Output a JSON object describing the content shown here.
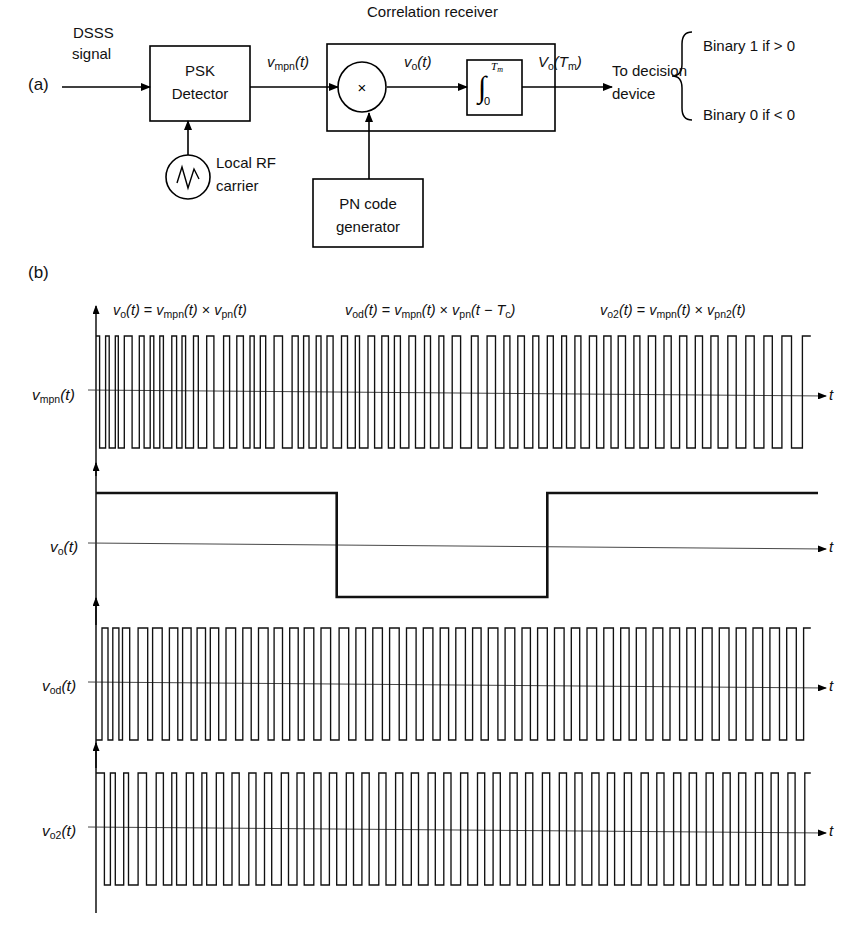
{
  "figure": {
    "panel_a_label": "(a)",
    "panel_b_label": "(b)"
  },
  "block_diagram": {
    "input_label_line1": "DSSS",
    "input_label_line2": "signal",
    "receiver_box_title": "Correlation receiver",
    "psk_detector": {
      "line1": "PSK",
      "line2": "Detector"
    },
    "local_osc": {
      "line1": "Local RF",
      "line2": "carrier",
      "icon": "sine-oscillator-icon"
    },
    "pn_generator": {
      "line1": "PN code",
      "line2": "generator"
    },
    "multiplier_symbol": "×",
    "integrator": {
      "upper_limit": "T",
      "upper_limit_sub": "m",
      "lower_limit": "0",
      "symbol": "∫"
    },
    "signal_vmpn": {
      "base": "v",
      "sub": "mpn",
      "arg": "(t)"
    },
    "signal_vo": {
      "base": "v",
      "sub": "o",
      "arg": "(t)"
    },
    "signal_voTm": {
      "base": "V",
      "sub": "o",
      "arg": "(T",
      "arg_sub": "m",
      "arg_end": ")"
    },
    "decision_line1": "To decision",
    "decision_line2": "device",
    "decision_rule_1": "Binary 1 if > 0",
    "decision_rule_2": "Binary 0 if < 0"
  },
  "waveforms": {
    "equations": [
      {
        "id": "eq-vo",
        "text": "vₒ(t) = vₘₚₙ(t) × vₚₙ(t)"
      },
      {
        "id": "eq-vod",
        "text": "vₒₔ(t) = vₘₚₙ(t) × vₚₙ(t − Tₑ)"
      },
      {
        "id": "eq-vo2",
        "text": "vₒ₂(t) = vₘₚₙ(t) × vₚₙ₂(t)"
      }
    ],
    "equation_parts": [
      {
        "lhs_base": "v",
        "lhs_sub": "o",
        "lhs_arg": "(t)",
        "eq": "=",
        "r1_base": "v",
        "r1_sub": "mpn",
        "r1_arg": "(t)",
        "times": "×",
        "r2_base": "v",
        "r2_sub": "pn",
        "r2_arg": "(t)"
      },
      {
        "lhs_base": "v",
        "lhs_sub": "od",
        "lhs_arg": "(t)",
        "eq": "=",
        "r1_base": "v",
        "r1_sub": "mpn",
        "r1_arg": "(t)",
        "times": "×",
        "r2_base": "v",
        "r2_sub": "pn",
        "r2_arg": "(t − T",
        "r2_arg_sub": "c",
        "r2_arg_end": ")"
      },
      {
        "lhs_base": "v",
        "lhs_sub": "o2",
        "lhs_arg": "(t)",
        "eq": "=",
        "r1_base": "v",
        "r1_sub": "mpn",
        "r1_arg": "(t)",
        "times": "×",
        "r2_base": "v",
        "r2_sub": "pn2",
        "r2_arg": "(t)"
      }
    ],
    "traces": [
      {
        "name": "v-mpn",
        "label_base": "v",
        "label_sub": "mpn",
        "label_arg": "(t)",
        "axis_label": "t"
      },
      {
        "name": "v-o",
        "label_base": "v",
        "label_sub": "o",
        "label_arg": "(t)",
        "axis_label": "t"
      },
      {
        "name": "v-od",
        "label_base": "v",
        "label_sub": "od",
        "label_arg": "(t)",
        "axis_label": "t"
      },
      {
        "name": "v-o2",
        "label_base": "v",
        "label_sub": "o2",
        "label_arg": "(t)",
        "axis_label": "t"
      }
    ]
  },
  "chart_data": {
    "type": "line",
    "xlabel": "t",
    "ylabel": "",
    "grid": false,
    "legend": "none",
    "x_range": [
      0,
      120
    ],
    "y_levels": {
      "high": 1,
      "low": -1
    },
    "series": [
      {
        "name": "v_mpn(t)",
        "note": "Received PSK-demodulated spread signal, bipolar chips, level alternates at each transition, starts high",
        "start_level": 1,
        "transitions": [
          0.6,
          1.6,
          2.2,
          3.2,
          3.7,
          4.7,
          6.0,
          7.2,
          8.0,
          9.0,
          9.6,
          10.6,
          11.2,
          12.6,
          13.4,
          14.3,
          14.9,
          16.2,
          17.0,
          18.4,
          19.6,
          21.2,
          22.2,
          23.4,
          24.5,
          25.6,
          26.3,
          27.3,
          28.2,
          29.6,
          31.0,
          32.6,
          33.6,
          34.5,
          35.4,
          36.6,
          37.4,
          38.4,
          39.4,
          40.8,
          41.8,
          43.1,
          43.8,
          45.2,
          46.3,
          47.5,
          48.6,
          49.6,
          50.6,
          52.0,
          53.1,
          54.6,
          55.6,
          57.0,
          57.8,
          59.2,
          60.6,
          62.4,
          63.5,
          65.0,
          66.4,
          67.8,
          68.8,
          70.1,
          71.2,
          72.6,
          73.6,
          75.0,
          76.0,
          77.4,
          78.2,
          79.6,
          80.6,
          82.0,
          83.2,
          84.4,
          85.6,
          86.8,
          88.0,
          89.4,
          90.4,
          91.8,
          93.0,
          94.4,
          95.6,
          97.0,
          98.2,
          99.6,
          100.8,
          102.2,
          103.4,
          105.0,
          106.4,
          108.0,
          109.4,
          111.0,
          112.4,
          114.0,
          115.6,
          117.4
        ]
      },
      {
        "name": "v_o(t)",
        "note": "Integrator input for matched PN code: smooth bipolar data waveform, three symbol intervals",
        "start_level": 1,
        "transitions": [
          40.0,
          75.0
        ],
        "symbol_bits": [
          1,
          0,
          1
        ]
      },
      {
        "name": "v_od(t)",
        "note": "Correlator output with PN code delayed by one chip T_c: residual chip-rate noise, starts low",
        "start_level": -1,
        "transitions": [
          1.0,
          2.0,
          2.8,
          3.8,
          4.4,
          5.6,
          7.0,
          8.6,
          9.4,
          11.0,
          12.2,
          13.6,
          14.4,
          15.8,
          16.8,
          18.2,
          19.0,
          20.4,
          21.6,
          23.2,
          24.4,
          25.8,
          27.0,
          28.6,
          29.6,
          31.0,
          32.2,
          33.6,
          34.6,
          36.2,
          37.4,
          39.0,
          40.4,
          42.0,
          43.2,
          44.8,
          46.0,
          47.6,
          48.8,
          50.4,
          51.6,
          53.2,
          54.4,
          56.0,
          57.2,
          58.6,
          59.8,
          61.4,
          62.6,
          64.0,
          65.2,
          66.8,
          68.0,
          69.6,
          70.8,
          72.2,
          73.4,
          75.0,
          76.2,
          77.8,
          79.0,
          80.4,
          81.6,
          83.2,
          84.4,
          86.0,
          87.2,
          88.6,
          89.8,
          91.4,
          92.6,
          94.2,
          95.4,
          97.0,
          98.2,
          99.6,
          100.8,
          102.4,
          103.6,
          105.2,
          106.4,
          108.0,
          109.2,
          110.8,
          112.0,
          113.6,
          114.8,
          116.4,
          117.6
        ]
      },
      {
        "name": "v_o2(t)",
        "note": "Correlator output for a non-matching PN code v_pn2: uncorrelated chip-rate waveform, starts high",
        "start_level": 1,
        "transitions": [
          1.4,
          2.4,
          3.2,
          4.6,
          5.4,
          7.0,
          8.4,
          10.0,
          11.2,
          12.6,
          13.4,
          15.0,
          16.2,
          17.6,
          18.4,
          20.0,
          21.2,
          22.6,
          23.8,
          25.4,
          26.6,
          28.0,
          29.2,
          30.8,
          32.0,
          33.4,
          34.6,
          36.2,
          37.4,
          38.8,
          40.0,
          41.6,
          42.8,
          44.2,
          45.4,
          47.0,
          48.2,
          49.8,
          51.0,
          52.4,
          53.6,
          55.2,
          56.4,
          57.8,
          59.0,
          60.6,
          61.8,
          63.4,
          64.6,
          66.0,
          67.2,
          68.8,
          70.0,
          71.4,
          72.6,
          74.2,
          75.4,
          77.0,
          78.2,
          79.6,
          80.8,
          82.4,
          83.6,
          85.0,
          86.2,
          87.8,
          89.0,
          90.6,
          91.8,
          93.2,
          94.4,
          96.0,
          97.2,
          98.6,
          99.8,
          101.4,
          102.6,
          104.2,
          105.4,
          106.8,
          108.0,
          109.6,
          110.8,
          112.2,
          113.4,
          115.0,
          116.2,
          117.8
        ]
      }
    ]
  }
}
